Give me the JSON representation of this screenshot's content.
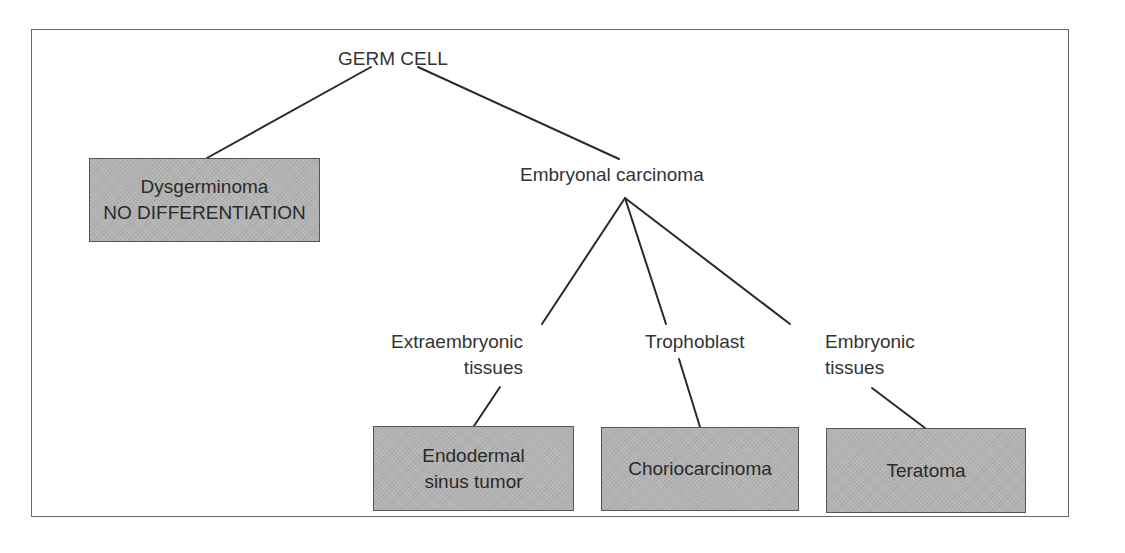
{
  "diagram": {
    "type": "tree",
    "root": {
      "label": "GERM CELL"
    },
    "nodes": {
      "dysgerminoma": {
        "line1": "Dysgerminoma",
        "line2": "NO DIFFERENTIATION",
        "style": "box"
      },
      "embryonal_carcinoma": {
        "label": "Embryonal carcinoma",
        "style": "text"
      },
      "extraembryonic_tissues": {
        "line1": "Extraembryonic",
        "line2": "tissues",
        "style": "text"
      },
      "trophoblast": {
        "label": "Trophoblast",
        "style": "text"
      },
      "embryonic_tissues": {
        "line1": "Embryonic",
        "line2": "tissues",
        "style": "text"
      },
      "endodermal_sinus_tumor": {
        "line1": "Endodermal",
        "line2": "sinus tumor",
        "style": "box"
      },
      "choriocarcinoma": {
        "label": "Choriocarcinoma",
        "style": "box"
      },
      "teratoma": {
        "label": "Teratoma",
        "style": "box"
      }
    },
    "edges": [
      [
        "GERM CELL",
        "Dysgerminoma"
      ],
      [
        "GERM CELL",
        "Embryonal carcinoma"
      ],
      [
        "Embryonal carcinoma",
        "Extraembryonic tissues"
      ],
      [
        "Embryonal carcinoma",
        "Trophoblast"
      ],
      [
        "Embryonal carcinoma",
        "Embryonic tissues"
      ],
      [
        "Extraembryonic tissues",
        "Endodermal sinus tumor"
      ],
      [
        "Trophoblast",
        "Choriocarcinoma"
      ],
      [
        "Embryonic tissues",
        "Teratoma"
      ]
    ],
    "colors": {
      "box_fill": "#b3b3b3",
      "box_border": "#555555",
      "line": "#2a2a2a",
      "frame": "#6a6a6a",
      "text": "#2a2a2a"
    }
  }
}
